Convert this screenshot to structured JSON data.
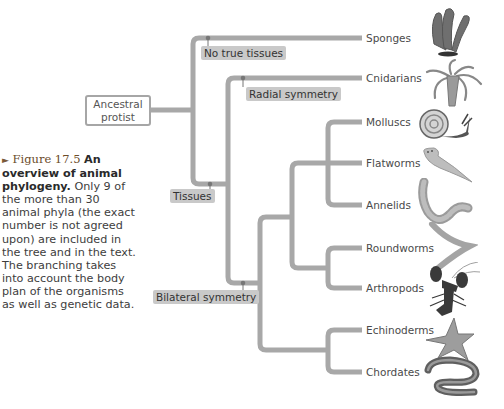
{
  "caption": {
    "arrow_icon": "►",
    "figure_label": "Figure 17.5",
    "title_bold": "An overview of animal phylogeny.",
    "body": "Only 9 of the more than 30 animal phyla (the exact number is not agreed upon) are included in the tree and in the text. The branching takes into account the body plan of the organisms as well as genetic data."
  },
  "root": {
    "label": "Ancestral protist"
  },
  "node_labels": {
    "no_true_tissues": "No true tissues",
    "radial_symmetry": "Radial symmetry",
    "tissues": "Tissues",
    "bilateral_symmetry": "Bilateral symmetry"
  },
  "taxa": [
    {
      "name": "Sponges",
      "icon": "sponge-illustration"
    },
    {
      "name": "Cnidarians",
      "icon": "hydra-illustration"
    },
    {
      "name": "Molluscs",
      "icon": "snail-illustration"
    },
    {
      "name": "Flatworms",
      "icon": "flatworm-illustration"
    },
    {
      "name": "Annelids",
      "icon": "earthworm-illustration"
    },
    {
      "name": "Roundworms",
      "icon": "roundworm-illustration"
    },
    {
      "name": "Arthropods",
      "icon": "lobster-illustration"
    },
    {
      "name": "Echinoderms",
      "icon": "starfish-illustration"
    },
    {
      "name": "Chordates",
      "icon": "eel-illustration"
    }
  ],
  "colors": {
    "branch": "#a8a8a8",
    "node_label_bg": "#c9c9c9",
    "node_dot": "#777777"
  }
}
